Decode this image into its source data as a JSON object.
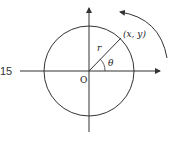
{
  "diagram": {
    "left_label": "15",
    "origin_label": "O",
    "radius_label": "r",
    "point_label": "(x, y)",
    "angle_label": "θ",
    "colors": {
      "stroke": "#333333",
      "background": "#ffffff"
    }
  }
}
